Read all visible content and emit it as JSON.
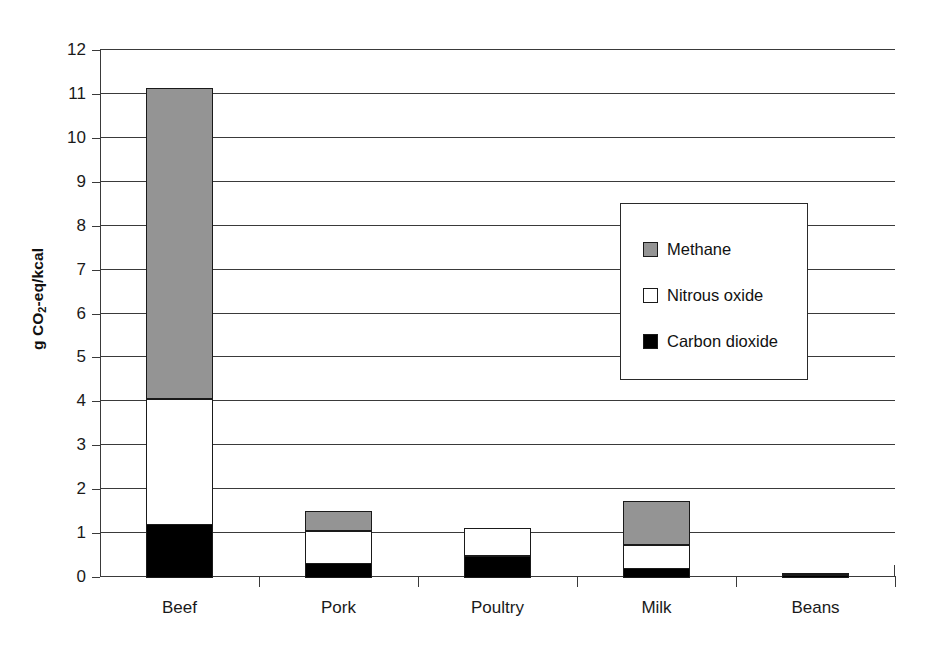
{
  "chart_data": {
    "type": "bar",
    "subtype": "stacked-bar",
    "title": "",
    "xlabel": "",
    "ylabel": "g CO2-eq/kcal",
    "ylabel_rich": {
      "prefix": "g CO",
      "sub": "2",
      "suffix": "-eq/kcal"
    },
    "categories": [
      "Beef",
      "Pork",
      "Poultry",
      "Milk",
      "Beans"
    ],
    "series": [
      {
        "name": "Carbon dioxide",
        "color": "#000000",
        "values": [
          1.22,
          0.32,
          0.48,
          0.22,
          0.02
        ]
      },
      {
        "name": "Nitrous oxide",
        "color": "#ffffff",
        "values": [
          2.88,
          0.78,
          0.65,
          0.56,
          0.05
        ]
      },
      {
        "name": "Methane",
        "color": "#949494",
        "values": [
          7.07,
          0.45,
          0.0,
          1.0,
          0.0
        ]
      }
    ],
    "totals": [
      11.17,
      1.55,
      1.13,
      1.78,
      0.07
    ],
    "ylim": [
      0,
      12
    ],
    "yticks": [
      0,
      1,
      2,
      3,
      4,
      5,
      6,
      7,
      8,
      9,
      10,
      11,
      12
    ],
    "ytick_labels": [
      "0",
      "1",
      "2",
      "3",
      "4",
      "5",
      "6",
      "7",
      "8",
      "9",
      "10",
      "11",
      "12"
    ],
    "grid": true,
    "grid_axis": "y",
    "legend_position": "inside-upper-right",
    "legend_entries": [
      {
        "label": "Methane",
        "color": "#949494",
        "swatch": "methane-swatch"
      },
      {
        "label": "Nitrous oxide",
        "color": "#ffffff",
        "swatch": "nitrous-oxide-swatch"
      },
      {
        "label": "Carbon dioxide",
        "color": "#000000",
        "swatch": "carbon-dioxide-swatch"
      }
    ]
  }
}
